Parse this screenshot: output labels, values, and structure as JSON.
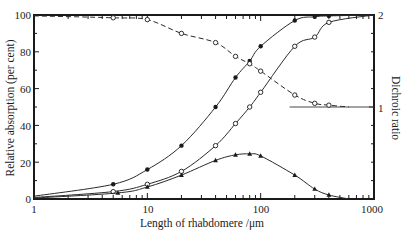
{
  "chart_data": {
    "type": "line",
    "title": "",
    "xlabel": "Length of rhabdomere /μm",
    "ylabel": "Relative absorption  (per cent)",
    "y2label": "Dichroic ratio",
    "xscale": "log",
    "xlim": [
      1,
      1000
    ],
    "ylim": [
      0,
      100
    ],
    "y2lim": [
      0,
      2
    ],
    "grid": false,
    "legend": "none",
    "x_ticks": [
      "1",
      "10",
      "100",
      "1000"
    ],
    "y_ticks": [
      "0",
      "20",
      "40",
      "60",
      "80",
      "100"
    ],
    "y2_ticks": [
      "1",
      "2"
    ],
    "series": [
      {
        "name": "Absorption (filled circles)",
        "axis": "left",
        "marker": "filled-circle",
        "line": "solid",
        "curve_start": [
          1,
          1.5
        ],
        "x": [
          5,
          10,
          20,
          40,
          60,
          80,
          100,
          200,
          300,
          400
        ],
        "y": [
          8,
          16,
          29,
          50,
          66,
          75,
          83,
          97,
          99,
          99.5
        ],
        "curve_end": [
          1000,
          100
        ]
      },
      {
        "name": "Absorption (open circles)",
        "axis": "left",
        "marker": "open-circle",
        "line": "solid",
        "curve_start": [
          1,
          0.8
        ],
        "x": [
          5,
          10,
          20,
          40,
          60,
          80,
          100,
          200,
          300,
          400
        ],
        "y": [
          4,
          8,
          15,
          29,
          41,
          50,
          58,
          83,
          88,
          96
        ],
        "curve_end": [
          1000,
          100
        ]
      },
      {
        "name": "Difference (triangles)",
        "axis": "left",
        "marker": "filled-triangle",
        "line": "solid",
        "curve_start": [
          1,
          0.5
        ],
        "x": [
          5.5,
          10,
          20,
          40,
          60,
          80,
          100,
          200,
          300,
          400
        ],
        "y": [
          3.3,
          6.5,
          13,
          21,
          24,
          24.5,
          23.4,
          13,
          5.4,
          2.2
        ],
        "curve_end": [
          600,
          0
        ]
      },
      {
        "name": "Dichroic ratio (dashed)",
        "axis": "right",
        "marker": "open-circle",
        "line": "dashed",
        "curve_start": [
          1,
          1.99
        ],
        "x": [
          5,
          10,
          20,
          40,
          60,
          80,
          100,
          200,
          300,
          400
        ],
        "y": [
          1.97,
          1.95,
          1.8,
          1.7,
          1.55,
          1.47,
          1.39,
          1.13,
          1.04,
          1.02
        ],
        "curve_end": [
          600,
          1.0
        ]
      }
    ],
    "annotations": [
      {
        "type": "hline",
        "axis": "right",
        "y": 1.0,
        "x_from": 180,
        "x_to": 1000
      }
    ]
  }
}
